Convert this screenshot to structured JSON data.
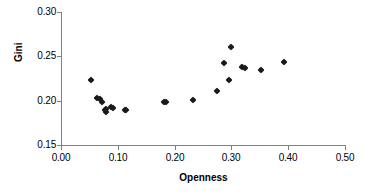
{
  "chart_data": {
    "type": "scatter",
    "title": "",
    "xlabel": "Openness",
    "ylabel": "Gini",
    "xlim": [
      0.0,
      0.5
    ],
    "ylim": [
      0.15,
      0.3
    ],
    "xticks": [
      "0.00",
      "0.10",
      "0.20",
      "0.30",
      "0.40",
      "0.50"
    ],
    "xtick_values": [
      0.0,
      0.1,
      0.2,
      0.3,
      0.4,
      0.5
    ],
    "yticks": [
      "0.15",
      "0.20",
      "0.25",
      "0.30"
    ],
    "ytick_values": [
      0.15,
      0.2,
      0.25,
      0.3
    ],
    "grid": false,
    "legend": false,
    "marker": "diamond",
    "marker_color": "#1a1a1a",
    "points": [
      {
        "x": 0.053,
        "y": 0.223
      },
      {
        "x": 0.063,
        "y": 0.203
      },
      {
        "x": 0.068,
        "y": 0.202
      },
      {
        "x": 0.072,
        "y": 0.199
      },
      {
        "x": 0.077,
        "y": 0.189
      },
      {
        "x": 0.079,
        "y": 0.187
      },
      {
        "x": 0.08,
        "y": 0.191
      },
      {
        "x": 0.088,
        "y": 0.193
      },
      {
        "x": 0.092,
        "y": 0.192
      },
      {
        "x": 0.113,
        "y": 0.19
      },
      {
        "x": 0.115,
        "y": 0.189
      },
      {
        "x": 0.181,
        "y": 0.199
      },
      {
        "x": 0.185,
        "y": 0.199
      },
      {
        "x": 0.233,
        "y": 0.201
      },
      {
        "x": 0.275,
        "y": 0.211
      },
      {
        "x": 0.287,
        "y": 0.242
      },
      {
        "x": 0.296,
        "y": 0.223
      },
      {
        "x": 0.3,
        "y": 0.261
      },
      {
        "x": 0.319,
        "y": 0.238
      },
      {
        "x": 0.323,
        "y": 0.237
      },
      {
        "x": 0.352,
        "y": 0.235
      },
      {
        "x": 0.393,
        "y": 0.244
      }
    ]
  }
}
